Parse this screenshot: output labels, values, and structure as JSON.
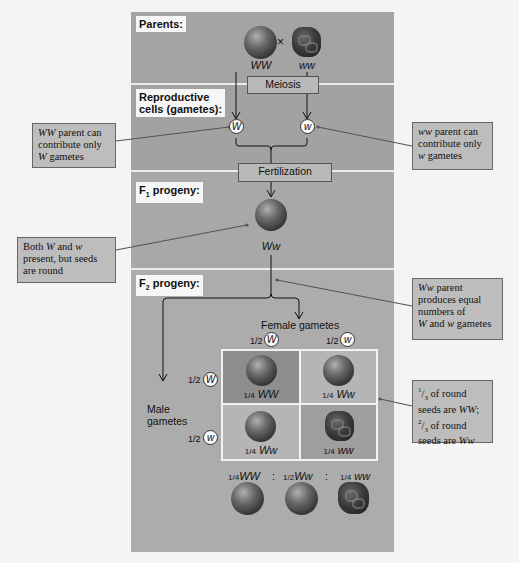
{
  "sections": {
    "parents": {
      "label": "Parents:",
      "cross_symbol": "×",
      "left_genotype": "WW",
      "right_genotype": "ww"
    },
    "meiosis": {
      "label": "Meiosis"
    },
    "gametes": {
      "label_line1": "Reproductive",
      "label_line2": "cells (gametes):",
      "left_allele": "W",
      "right_allele": "w"
    },
    "fertilization": {
      "label": "Fertilization"
    },
    "f1": {
      "label_main": "F",
      "label_sub": "1",
      "label_rest": " progeny:",
      "genotype": "Ww"
    },
    "f2": {
      "label_main": "F",
      "label_sub": "2",
      "label_rest": " progeny:",
      "female_gametes_label": "Female gametes",
      "male_gametes_line1": "Male",
      "male_gametes_line2": "gametes",
      "female_gametes": [
        {
          "fraction": "1/2",
          "allele": "W"
        },
        {
          "fraction": "1/2",
          "allele": "w"
        }
      ],
      "male_gametes": [
        {
          "fraction": "1/2",
          "allele": "W"
        },
        {
          "fraction": "1/2",
          "allele": "w"
        }
      ],
      "punnett": [
        {
          "fraction": "1/4",
          "genotype": "WW",
          "phenotype": "round"
        },
        {
          "fraction": "1/4",
          "genotype": "Ww",
          "phenotype": "round"
        },
        {
          "fraction": "1/4",
          "genotype": "Ww",
          "phenotype": "round"
        },
        {
          "fraction": "1/4",
          "genotype": "ww",
          "phenotype": "wrinkled"
        }
      ],
      "ratio": [
        {
          "fraction": "1/4",
          "genotype": "WW"
        },
        {
          "separator": ":"
        },
        {
          "fraction": "1/2",
          "genotype": "Ww"
        },
        {
          "separator": ":"
        },
        {
          "fraction": "1/4",
          "genotype": "ww"
        }
      ]
    }
  },
  "callouts": {
    "ww_parent_left": {
      "lines": [
        "WW parent can",
        "contribute only",
        "W gametes"
      ]
    },
    "ww_parent_right": {
      "lines": [
        "ww parent can",
        "contribute only",
        "w gametes"
      ]
    },
    "both_present": {
      "lines": [
        "Both W and w",
        "present, but seeds",
        "are round"
      ]
    },
    "ww_parent_equal": {
      "lines": [
        "Ww parent",
        "produces equal",
        "numbers of",
        "W and w gametes"
      ]
    },
    "third_round": {
      "lines": [
        "1/3 of round",
        "seeds are WW;",
        "2/3 of round",
        "seeds are Ww"
      ]
    }
  },
  "colors": {
    "panel": "#a7a7a7",
    "callout": "#bdbdbd",
    "divider": "#ececec",
    "punnett_dark": "#8e8e8e",
    "punnett_light": "#b5b5b5"
  }
}
